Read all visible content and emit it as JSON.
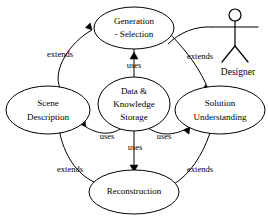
{
  "diagram": {
    "type": "uml-use-case-diagram",
    "title": "",
    "stroke_color": "#000000",
    "fill_color": "#ffffff",
    "background": "#ffffff",
    "use_cases": [
      {
        "id": "generation-selection",
        "lines": [
          "Generation",
          "- Selection"
        ],
        "cx": 134,
        "cy": 28,
        "rx": 40,
        "ry": 21
      },
      {
        "id": "data-knowledge-storage",
        "lines": [
          "Data &",
          "Knowledge",
          "Storage"
        ],
        "cx": 134,
        "cy": 104,
        "rx": 36,
        "ry": 27
      },
      {
        "id": "scene-description",
        "lines": [
          "Scene",
          "Description"
        ],
        "cx": 48,
        "cy": 110,
        "rx": 42,
        "ry": 24
      },
      {
        "id": "solution-understanding",
        "lines": [
          "Solution",
          "Understanding"
        ],
        "cx": 220,
        "cy": 110,
        "rx": 45,
        "ry": 24
      },
      {
        "id": "reconstruction",
        "lines": [
          "Reconstruction"
        ],
        "cx": 134,
        "cy": 192,
        "rx": 45,
        "ry": 22
      }
    ],
    "actor": {
      "id": "designer",
      "label": "Designer",
      "head_cx": 235,
      "head_cy": 15,
      "head_r": 6,
      "body_top_y": 21,
      "body_bottom_y": 46,
      "arm_y": 27,
      "arm_left_x": 212,
      "arm_right_x": 258,
      "leg_left_x": 222,
      "leg_right_x": 248,
      "leg_y": 62,
      "label_x": 238,
      "label_y": 73
    },
    "relationships": [
      {
        "id": "scene-to-generation",
        "label": "extends",
        "from": "scene-description",
        "to": "generation-selection",
        "label_x": 60,
        "label_y": 55,
        "path": "M 60,88 C 52,70 70,42 92,30",
        "arrow_at": [
          92,
          30
        ],
        "arrow_angle": 200
      },
      {
        "id": "generation-to-solution",
        "label": "extends",
        "from": "generation-selection",
        "to": "solution-understanding",
        "label_x": 200,
        "label_y": 57,
        "path": "M 168,32 C 180,44 196,62 206,84",
        "arrow_at": [
          206,
          84
        ],
        "arrow_angle": 65
      },
      {
        "id": "generation-uses-data",
        "label": "uses",
        "from": "generation-selection",
        "to": "data-knowledge-storage",
        "label_x": 134,
        "label_y": 66,
        "path": "M 134,49 L 134,77",
        "arrow_at": [
          134,
          52
        ],
        "arrow_angle": -90
      },
      {
        "id": "data-uses-scene",
        "label": "uses",
        "from": "data-knowledge-storage",
        "to": "scene-description",
        "label_x": 107,
        "label_y": 137,
        "path": "M 122,128 C 110,136 98,134 86,127",
        "arrow_at": [
          86,
          127
        ],
        "arrow_angle": 210
      },
      {
        "id": "data-uses-solution",
        "label": "uses",
        "from": "data-knowledge-storage",
        "to": "solution-understanding",
        "label_x": 164,
        "label_y": 137,
        "path": "M 148,128 C 162,137 176,135 190,127",
        "arrow_at": [
          190,
          127
        ],
        "arrow_angle": -30
      },
      {
        "id": "data-uses-reconstruction",
        "label": "uses",
        "from": "data-knowledge-storage",
        "to": "reconstruction",
        "label_x": 135,
        "label_y": 146,
        "path": "M 134,131 L 134,170",
        "arrow_at": [
          134,
          170
        ],
        "arrow_angle": 90
      },
      {
        "id": "reconstruction-to-scene",
        "label": "extends",
        "from": "reconstruction",
        "to": "scene-description",
        "label_x": 70,
        "label_y": 170,
        "path": "M 96,183 C 80,176 66,160 60,134",
        "arrow_at": [
          60,
          134
        ],
        "arrow_angle": -255
      },
      {
        "id": "solution-to-reconstruction",
        "label": "extends",
        "from": "solution-understanding",
        "to": "reconstruction",
        "label_x": 200,
        "label_y": 170,
        "path": "M 210,133 C 202,156 190,174 174,184",
        "arrow_at": [
          174,
          184
        ],
        "arrow_angle": 150
      },
      {
        "id": "designer-to-generation",
        "label": "",
        "from": "designer",
        "to": "generation-selection",
        "label_x": 0,
        "label_y": 0,
        "path": "M 212,27 C 196,26 180,32 168,44",
        "arrow_at": null,
        "arrow_angle": 0
      }
    ],
    "edge_labels": [
      "extends",
      "extends",
      "uses",
      "uses",
      "uses",
      "uses",
      "extends",
      "extends"
    ]
  }
}
